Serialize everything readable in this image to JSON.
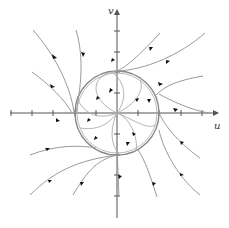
{
  "diagram": {
    "type": "phase-portrait",
    "axes": {
      "x_label": "u",
      "y_label": "v",
      "x_ticks": [
        -3,
        -2,
        -1,
        1,
        2,
        3
      ],
      "y_ticks": [
        -3,
        -2,
        -1,
        1,
        2,
        3
      ]
    },
    "colors": {
      "axis": "#555555",
      "trajectory": "#9a9a9a",
      "limit_cycle": "#888888",
      "arrow": "#111111"
    },
    "limit_cycle": {
      "center": [
        0,
        0
      ],
      "radius": 1.4
    }
  }
}
